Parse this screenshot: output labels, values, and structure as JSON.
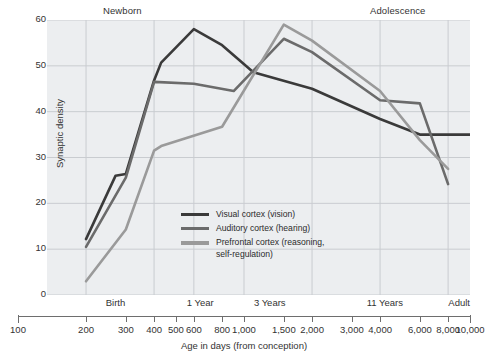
{
  "chart_data": {
    "type": "line",
    "title": "",
    "xlabel": "Age in days (from conception)",
    "ylabel": "Synaptic density",
    "xscale": "log",
    "xlim": [
      100,
      10000
    ],
    "ylim": [
      0,
      60
    ],
    "grid": true,
    "legend_position": "inside-center-left",
    "y_ticks": [
      60,
      50,
      40,
      30,
      20,
      10,
      0
    ],
    "x_ticks": [
      100,
      200,
      300,
      400,
      500,
      600,
      800,
      1000,
      1500,
      2000,
      3000,
      4000,
      6000,
      8000,
      10000
    ],
    "x_tick_labels": [
      "100",
      "200",
      "300",
      "400",
      "500",
      "600",
      "800",
      "1,000",
      "1,500",
      "2,000",
      "3,000",
      "4,000",
      "6,000",
      "8,000",
      "10,000"
    ],
    "top_annotations": [
      {
        "label": "Newborn",
        "x": 300
      },
      {
        "label": "Adolescence",
        "x": 5000
      }
    ],
    "x_stage_labels": [
      {
        "label": "Birth",
        "x": 270
      },
      {
        "label": "1 Year",
        "x": 640
      },
      {
        "label": "3 Years",
        "x": 1300
      },
      {
        "label": "11 Years",
        "x": 4200
      },
      {
        "label": "Adult",
        "x": 10000
      }
    ],
    "series": [
      {
        "name": "Visual cortex (vision)",
        "color": "#3a3a3a",
        "points": [
          {
            "x": 200,
            "y": 12.2
          },
          {
            "x": 270,
            "y": 26.0
          },
          {
            "x": 300,
            "y": 26.4
          },
          {
            "x": 400,
            "y": 46.8
          },
          {
            "x": 430,
            "y": 50.7
          },
          {
            "x": 600,
            "y": 58.0
          },
          {
            "x": 800,
            "y": 54.5
          },
          {
            "x": 1100,
            "y": 48.6
          },
          {
            "x": 2000,
            "y": 45.0
          },
          {
            "x": 4000,
            "y": 38.4
          },
          {
            "x": 6000,
            "y": 35.0
          },
          {
            "x": 10000,
            "y": 35.0
          }
        ]
      },
      {
        "name": "Auditory cortex (hearing)",
        "color": "#6b6b6b",
        "points": [
          {
            "x": 200,
            "y": 10.5
          },
          {
            "x": 300,
            "y": 25.6
          },
          {
            "x": 400,
            "y": 46.5
          },
          {
            "x": 600,
            "y": 46.1
          },
          {
            "x": 900,
            "y": 44.5
          },
          {
            "x": 1500,
            "y": 55.9
          },
          {
            "x": 2000,
            "y": 53.0
          },
          {
            "x": 4000,
            "y": 42.5
          },
          {
            "x": 6000,
            "y": 41.8
          },
          {
            "x": 8000,
            "y": 24.2
          }
        ]
      },
      {
        "name": "Prefrontal cortex (reasoning,\nself-regulation)",
        "color": "#9a9a9a",
        "points": [
          {
            "x": 200,
            "y": 3.0
          },
          {
            "x": 300,
            "y": 14.3
          },
          {
            "x": 400,
            "y": 31.5
          },
          {
            "x": 430,
            "y": 32.5
          },
          {
            "x": 800,
            "y": 36.7
          },
          {
            "x": 1500,
            "y": 59.0
          },
          {
            "x": 2000,
            "y": 55.5
          },
          {
            "x": 4000,
            "y": 44.5
          },
          {
            "x": 6000,
            "y": 33.8
          },
          {
            "x": 8000,
            "y": 27.5
          }
        ]
      }
    ]
  },
  "legend": {
    "items": [
      {
        "label": "Visual cortex (vision)",
        "color": "#3a3a3a"
      },
      {
        "label": "Auditory cortex (hearing)",
        "color": "#6b6b6b"
      },
      {
        "label": "Prefrontal cortex (reasoning,\nself-regulation)",
        "color": "#9a9a9a"
      }
    ]
  },
  "colors": {
    "plot_background": "#eceef0",
    "grid": "#c9ccd0",
    "axis": "#6e6e6e",
    "text": "#333333"
  }
}
